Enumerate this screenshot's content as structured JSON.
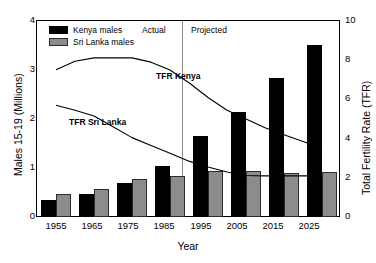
{
  "chart_data": {
    "type": "bar",
    "title": "",
    "xlabel": "Year",
    "ylabel": "Males 15-19 (Millions)",
    "ylabel_right": "Total Fertility Rate (TFR)",
    "categories": [
      "1955",
      "1965",
      "1975",
      "1985",
      "1995",
      "2005",
      "2015",
      "2025"
    ],
    "ylim": [
      0,
      4
    ],
    "yticks": [
      "0",
      "1",
      "2",
      "3",
      "4"
    ],
    "ylim_right": [
      0,
      10
    ],
    "yticks_right": [
      "0",
      "2",
      "4",
      "6",
      "8",
      "10"
    ],
    "grid": false,
    "legend_position": "top-left",
    "series": [
      {
        "name": "Kenya males",
        "type": "bar",
        "color": "#000000",
        "axis": "left",
        "values": [
          0.34,
          0.46,
          0.7,
          1.05,
          1.65,
          2.14,
          2.83,
          3.52
        ]
      },
      {
        "name": "Sri Lanka males",
        "type": "bar",
        "color": "#8c8c8c",
        "axis": "left",
        "values": [
          0.46,
          0.58,
          0.78,
          0.84,
          0.93,
          0.94,
          0.9,
          0.92
        ]
      },
      {
        "name": "TFR Kenya",
        "type": "line",
        "color": "#000000",
        "axis": "right",
        "x": [
          "1955",
          "1960",
          "1965",
          "1970",
          "1975",
          "1980",
          "1985",
          "1990",
          "1995",
          "2000",
          "2005",
          "2010",
          "2015",
          "2020",
          "2025"
        ],
        "values": [
          7.51,
          7.95,
          8.12,
          8.12,
          8.12,
          7.9,
          7.5,
          6.85,
          6.1,
          5.45,
          5.0,
          4.55,
          4.2,
          3.85,
          3.52
        ]
      },
      {
        "name": "TFR Sri Lanka",
        "type": "line",
        "color": "#000000",
        "axis": "right",
        "x": [
          "1955",
          "1960",
          "1965",
          "1970",
          "1975",
          "1980",
          "1985",
          "1990",
          "1995",
          "2000",
          "2005",
          "2010",
          "2015",
          "2020",
          "2025"
        ],
        "values": [
          5.7,
          5.45,
          5.15,
          4.6,
          4.05,
          3.65,
          3.25,
          2.85,
          2.55,
          2.3,
          2.12,
          2.1,
          2.1,
          2.1,
          2.1
        ]
      }
    ],
    "annotations": [
      {
        "name": "actual-label",
        "text": "Actual"
      },
      {
        "name": "projected-label",
        "text": "Projected"
      },
      {
        "name": "tfr-kenya-label",
        "text": "TFR Kenya"
      },
      {
        "name": "tfr-srilanka-label",
        "text": "TFR Sri Lanka"
      }
    ],
    "divider_year": "2000"
  },
  "axes": {
    "left": {
      "title": "Males 15-19 (Millions)",
      "ticks": [
        "4",
        "3",
        "2",
        "1",
        "0"
      ]
    },
    "right": {
      "title": "Total Fertility Rate (TFR)",
      "ticks": [
        "10",
        "8",
        "6",
        "4",
        "2",
        "0"
      ]
    },
    "bottom": {
      "title": "Year",
      "ticks": [
        "1955",
        "1965",
        "1975",
        "1985",
        "1995",
        "2005",
        "2015",
        "2025"
      ]
    }
  },
  "legend": {
    "items": [
      {
        "label": "Kenya males",
        "color": "#000000"
      },
      {
        "label": "Sri Lanka males",
        "color": "#8c8c8c"
      }
    ]
  },
  "annotations": {
    "actual": "Actual",
    "projected": "Projected",
    "tfr_kenya": "TFR Kenya",
    "tfr_sri_lanka": "TFR Sri Lanka"
  }
}
